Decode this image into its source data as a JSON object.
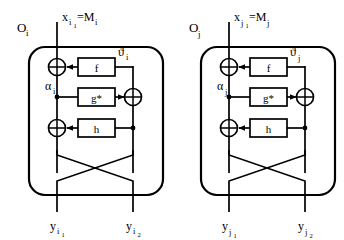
{
  "figure": {
    "type": "block-diagram",
    "background": "#ffffff",
    "stroke_color": "#000000",
    "width": 344,
    "height": 240
  },
  "panels": [
    {
      "id": "panel-i",
      "oracle_label": "O",
      "oracle_sub": "i",
      "input_label": "x",
      "input_sub": "i",
      "input_subsub": "1",
      "input_eq": "=M",
      "input_eq_sub": "i",
      "feedback_label": "ϑ",
      "feedback_sub": "i",
      "alpha_label": "α",
      "alpha_sub": "i",
      "blocks": [
        {
          "name": "f-block",
          "label": "f"
        },
        {
          "name": "g-star-block",
          "label": "g*"
        },
        {
          "name": "h-block",
          "label": "h"
        }
      ],
      "xor_nodes": [
        "xor-top-left",
        "xor-right-mid",
        "xor-bottom-left"
      ],
      "xor_glyph": "⊕",
      "outputs": [
        {
          "name": "output-left",
          "label": "y",
          "sub": "i",
          "subsub": "1"
        },
        {
          "name": "output-right",
          "label": "y",
          "sub": "i",
          "subsub": "2"
        }
      ]
    },
    {
      "id": "panel-j",
      "oracle_label": "O",
      "oracle_sub": "j",
      "input_label": "x",
      "input_sub": "j",
      "input_subsub": "1",
      "input_eq": "=M",
      "input_eq_sub": "j",
      "feedback_label": "ϑ",
      "feedback_sub": "j",
      "alpha_label": "α",
      "alpha_sub": "j",
      "blocks": [
        {
          "name": "f-block",
          "label": "f"
        },
        {
          "name": "g-star-block",
          "label": "g*"
        },
        {
          "name": "h-block",
          "label": "h"
        }
      ],
      "xor_nodes": [
        "xor-top-left",
        "xor-right-mid",
        "xor-bottom-left"
      ],
      "xor_glyph": "⊕",
      "outputs": [
        {
          "name": "output-left",
          "label": "y",
          "sub": "j",
          "subsub": "1"
        },
        {
          "name": "output-right",
          "label": "y",
          "sub": "j",
          "subsub": "2"
        }
      ]
    }
  ]
}
